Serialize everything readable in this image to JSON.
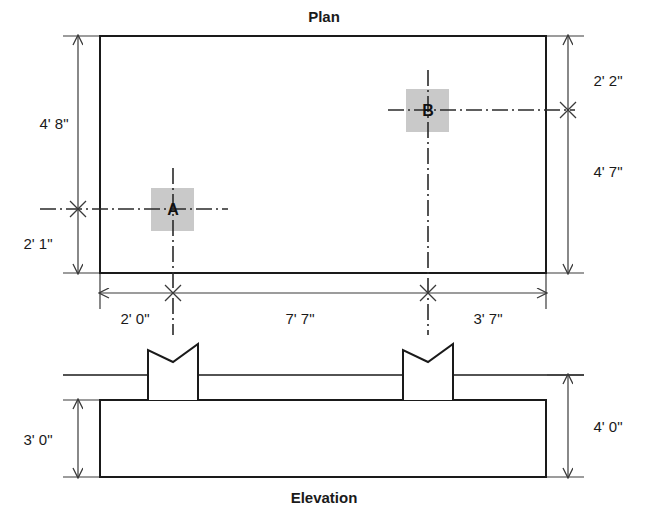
{
  "drawing": {
    "title_plan": "Plan",
    "title_elevation": "Elevation",
    "columns": [
      {
        "id": "A",
        "label": "A"
      },
      {
        "id": "B",
        "label": "B"
      }
    ],
    "dimensions": {
      "plan_left_upper": "4' 8\"",
      "plan_left_lower": "2' 1\"",
      "plan_right_upper": "2' 2\"",
      "plan_right_lower": "4' 7\"",
      "plan_bottom_left": "2' 0\"",
      "plan_bottom_middle": "7' 7\"",
      "plan_bottom_right": "3' 7\"",
      "elevation_left": "3' 0\"",
      "elevation_right": "4' 0\""
    },
    "colors": {
      "line": "#1a1a1a",
      "thin_line": "#3a3a3a",
      "pad_fill": "#c9c9c9",
      "background": "#ffffff"
    }
  }
}
